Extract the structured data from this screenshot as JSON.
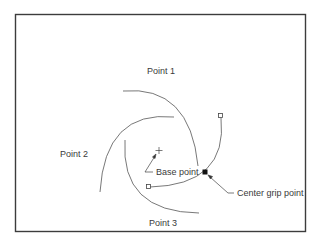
{
  "diagram": {
    "labels": {
      "point1": "Point 1",
      "point2": "Point 2",
      "point3": "Point 3",
      "base_point": "Base point",
      "center_grip_point": "Center grip point"
    },
    "colors": {
      "line": "#555555",
      "border": "#3c3c3c",
      "text": "#3a3a3a",
      "grip_fill": "#111111"
    },
    "icons": {
      "base_point_marker": "crosshair-icon",
      "center_grip": "filled-square-grip-icon",
      "end_grips": "hollow-square-grip-icon"
    }
  }
}
